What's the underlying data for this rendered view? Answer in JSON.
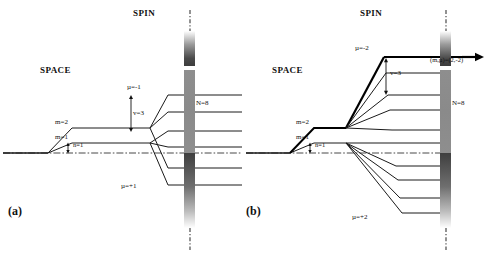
{
  "figure": {
    "panels": [
      {
        "id": "a",
        "panel_label": "(a)",
        "space_label": "SPACE",
        "spin_label": "SPIN",
        "n_label": "N=8",
        "nu_label": "v=3",
        "m2_label": "m=2",
        "m1_label": "m=1",
        "n1_label": "n=1",
        "mu_top_label": "µ=-1",
        "mu_bottom_label": "µ=+1",
        "level_count": 6
      },
      {
        "id": "b",
        "panel_label": "(b)",
        "space_label": "SPACE",
        "spin_label": "SPIN",
        "n_label": "N=8",
        "nu_label": "v=3",
        "m2_label": "m=2",
        "m1_label": "m=1",
        "n1_label": "n=1",
        "mu_top_label": "µ=-2",
        "mu_bottom_label": "µ=+2",
        "annotation_label": "(m,µ)=(2,-2)",
        "level_count": 10
      }
    ],
    "colors": {
      "line": "#1a1a1a",
      "highlight": "#000000",
      "axis": "#333333",
      "bar_mid": "#8e8e8e",
      "bar_dark": "#3f3f3f",
      "background": "#ffffff"
    }
  }
}
